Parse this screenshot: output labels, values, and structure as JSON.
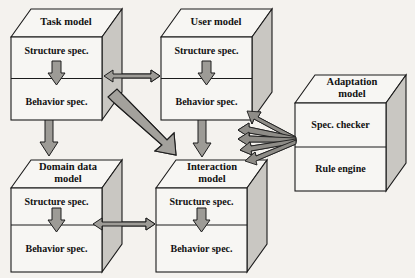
{
  "diagram": {
    "background_color": "#f4f2ee",
    "box_face_color": "#f7f6f3",
    "box_side_color": "#c9c7c2",
    "arrow_color": "#9d9b96",
    "outline_color": "#1b1b1b",
    "boxes": [
      {
        "id": "task-model",
        "title": "Task model",
        "title_lines": [
          "Task model"
        ],
        "cells": [
          "Structure spec.",
          "Behavior spec."
        ],
        "has_internal_arrow": true
      },
      {
        "id": "user-model",
        "title": "User model",
        "title_lines": [
          "User model"
        ],
        "cells": [
          "Structure spec.",
          "Behavior spec."
        ],
        "has_internal_arrow": true
      },
      {
        "id": "adaptation-model",
        "title": "Adaptation model",
        "title_lines": [
          "Adaptation",
          "model"
        ],
        "cells": [
          "Spec. checker",
          "Rule engine"
        ],
        "has_internal_arrow": false
      },
      {
        "id": "domain-data-model",
        "title": "Domain data model",
        "title_lines": [
          "Domain data",
          "model"
        ],
        "cells": [
          "Structure spec.",
          "Behavior spec."
        ],
        "has_internal_arrow": true
      },
      {
        "id": "interaction-model",
        "title": "Interaction model",
        "title_lines": [
          "Interaction",
          "model"
        ],
        "cells": [
          "Structure spec.",
          "Behavior spec."
        ],
        "has_internal_arrow": true
      }
    ],
    "connections": [
      {
        "id": "task-user",
        "from": "task-model",
        "to": "user-model",
        "style": "double-headed-horizontal"
      },
      {
        "id": "domain-interaction",
        "from": "domain-data-model",
        "to": "interaction-model",
        "style": "double-headed-horizontal"
      },
      {
        "id": "task-domain",
        "from": "task-model",
        "to": "domain-data-model",
        "style": "single-headed-vertical-down"
      },
      {
        "id": "user-interaction",
        "from": "user-model",
        "to": "interaction-model",
        "style": "single-headed-vertical-down"
      },
      {
        "id": "task-interaction",
        "from": "task-model",
        "to": "interaction-model",
        "style": "single-headed-diagonal-thick"
      },
      {
        "id": "adaptation-fan-1",
        "from": "adaptation-model",
        "to": "user-model",
        "style": "fan-arrow"
      },
      {
        "id": "adaptation-fan-2",
        "from": "adaptation-model",
        "to": "user-model",
        "style": "fan-arrow"
      },
      {
        "id": "adaptation-fan-3",
        "from": "adaptation-model",
        "to": "interaction-model",
        "style": "fan-arrow"
      },
      {
        "id": "adaptation-fan-4",
        "from": "adaptation-model",
        "to": "interaction-model",
        "style": "fan-arrow"
      },
      {
        "id": "adaptation-fan-5",
        "from": "adaptation-model",
        "to": "interaction-model",
        "style": "fan-arrow"
      }
    ]
  }
}
